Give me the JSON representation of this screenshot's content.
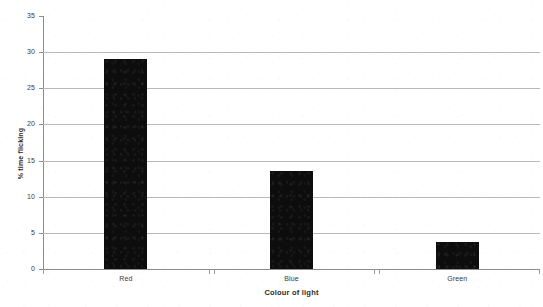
{
  "chart_data": {
    "type": "bar",
    "title": "",
    "subtitle": "",
    "xlabel": "Colour of light",
    "ylabel": "% time flicking",
    "categories": [
      "Red",
      "Blue",
      "Green"
    ],
    "values": [
      29,
      13.5,
      3.8
    ],
    "series": [
      {
        "name": "% time flicking",
        "values": [
          29,
          13.5,
          3.8
        ],
        "color": "#0d0d0d"
      }
    ],
    "ylim": [
      0,
      35
    ],
    "yticks": [
      0,
      5,
      10,
      15,
      20,
      25,
      30,
      35
    ],
    "ytick_labels": [
      "0",
      "5",
      "10",
      "15",
      "20",
      "25",
      "30",
      "35"
    ],
    "grid": true,
    "grid_axis": "y",
    "legend": false,
    "legend_position": "none",
    "annotations": [],
    "colors": {
      "bar": "#0d0d0d",
      "gridline": "#b9b9b9",
      "axis": "#8c8c8c",
      "text": "#2a2a2a",
      "background": "#ffffff"
    }
  }
}
